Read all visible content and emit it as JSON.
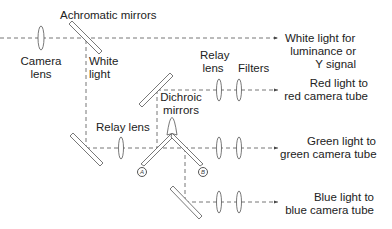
{
  "diagram": {
    "type": "optical beam-splitting diagram (color TV camera)",
    "labels": {
      "achromatic_mirrors": "Achromatic mirrors",
      "camera_lens_1": "Camera",
      "camera_lens_2": "lens",
      "white_light_1": "White",
      "white_light_2": "light",
      "relay_lens_upper_1": "Relay",
      "relay_lens_upper_2": "lens",
      "filters": "Filters",
      "relay_lens_lower": "Relay lens",
      "dichroic_1": "Dichroic",
      "dichroic_2": "mirrors",
      "mirror_a": "A",
      "mirror_b": "B"
    },
    "outputs": [
      {
        "line1": "White light for",
        "line2": "luminance or",
        "line3": "Y signal"
      },
      {
        "line1": "Red light to",
        "line2": "red camera tube"
      },
      {
        "line1": "Green light to",
        "line2": "green camera tube"
      },
      {
        "line1": "Blue light to",
        "line2": "blue camera tube"
      }
    ],
    "colors": {
      "line": "#555555",
      "text": "#222222",
      "background": "#ffffff"
    }
  }
}
